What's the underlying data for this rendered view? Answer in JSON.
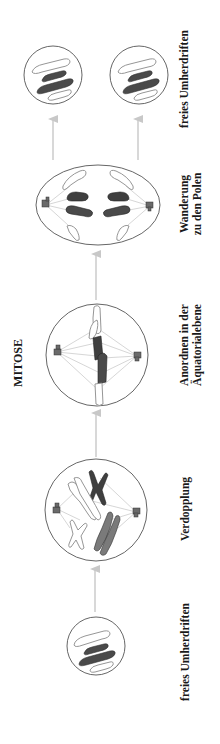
{
  "diagram": {
    "title": "MITOSE",
    "orientation": "rotated-90-ccw",
    "stages": [
      {
        "id": "stage-1",
        "label_lines": [
          "freies Umherdriften"
        ],
        "shape": "small-circle"
      },
      {
        "id": "stage-2",
        "label_lines": [
          "Verdopplung"
        ],
        "shape": "circle"
      },
      {
        "id": "stage-3",
        "label_lines": [
          "Anordnen in der",
          "Äquatorialebene"
        ],
        "shape": "circle"
      },
      {
        "id": "stage-4",
        "label_lines": [
          "Wanderung",
          "zu den Polen"
        ],
        "shape": "ellipse"
      },
      {
        "id": "stage-5",
        "label_lines": [
          "freies Umherdriften"
        ],
        "shape": "two-small-circles"
      }
    ],
    "arrows": [
      {
        "from": "stage-1",
        "to": "stage-2"
      },
      {
        "from": "stage-2",
        "to": "stage-3"
      },
      {
        "from": "stage-3",
        "to": "stage-4"
      },
      {
        "from": "stage-4",
        "to": "stage-5-a"
      },
      {
        "from": "stage-4",
        "to": "stage-5-b"
      }
    ],
    "colors": {
      "outline": "#555555",
      "chromosome_dark": "#4a4a4a",
      "chromosome_mid": "#7a7a7a",
      "chromosome_light": "#ffffff",
      "spindle": "#bbbbbb",
      "arrow": "#c8c8c8",
      "text": "#1a1a1a"
    }
  }
}
